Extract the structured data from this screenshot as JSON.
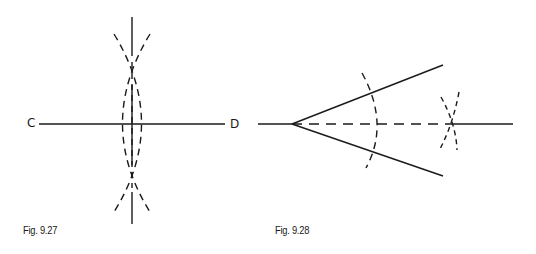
{
  "figures": [
    {
      "caption": "Fig. 9.27",
      "labels": {
        "left": "C",
        "right": "D"
      },
      "description": "Perpendicular bisector of line segment CD using intersecting arcs"
    },
    {
      "caption": "Fig. 9.28",
      "description": "Bisecting an angle using arcs; dashed bisector line"
    }
  ],
  "colors": {
    "ink": "#1a1a1a",
    "background": "#ffffff"
  }
}
